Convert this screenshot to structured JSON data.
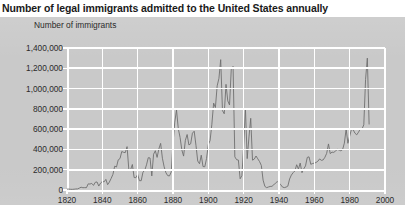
{
  "title": "Number of legal immigrants admitted to the United States annually",
  "axis_label_y": "Number of immigrants",
  "colors": {
    "panel_background": "#c9c9c9",
    "page_background": "#ffffff",
    "gridline": "#ffffff",
    "series_line": "#6e6e6e",
    "title_text": "#1a1a1a",
    "tick_text": "#2b2b2b"
  },
  "chart_data": {
    "type": "line",
    "title": "Number of legal immigrants admitted to the United States annually",
    "xlabel": "",
    "ylabel": "Number of immigrants",
    "xlim": [
      1820,
      2000
    ],
    "ylim": [
      0,
      1400000
    ],
    "grid": true,
    "legend_position": "none",
    "x_tick_labels": [
      "1820",
      "1840",
      "1860",
      "1880",
      "1900",
      "1920",
      "1940",
      "1960",
      "1980",
      "2000"
    ],
    "x_ticks": [
      1820,
      1840,
      1860,
      1880,
      1900,
      1920,
      1940,
      1960,
      1980,
      2000
    ],
    "y_tick_labels": [
      "0",
      "200,000",
      "400,000",
      "600,000",
      "800,000",
      "1,000,000",
      "1,200,000",
      "1,400,000"
    ],
    "y_ticks": [
      0,
      200000,
      400000,
      600000,
      800000,
      1000000,
      1200000,
      1400000
    ],
    "series": [
      {
        "name": "Legal immigrants admitted annually",
        "x": [
          1820,
          1821,
          1822,
          1823,
          1824,
          1825,
          1826,
          1827,
          1828,
          1829,
          1830,
          1831,
          1832,
          1833,
          1834,
          1835,
          1836,
          1837,
          1838,
          1839,
          1840,
          1841,
          1842,
          1843,
          1844,
          1845,
          1846,
          1847,
          1848,
          1849,
          1850,
          1851,
          1852,
          1853,
          1854,
          1855,
          1856,
          1857,
          1858,
          1859,
          1860,
          1861,
          1862,
          1863,
          1864,
          1865,
          1866,
          1867,
          1868,
          1869,
          1870,
          1871,
          1872,
          1873,
          1874,
          1875,
          1876,
          1877,
          1878,
          1879,
          1880,
          1881,
          1882,
          1883,
          1884,
          1885,
          1886,
          1887,
          1888,
          1889,
          1890,
          1891,
          1892,
          1893,
          1894,
          1895,
          1896,
          1897,
          1898,
          1899,
          1900,
          1901,
          1902,
          1903,
          1904,
          1905,
          1906,
          1907,
          1908,
          1909,
          1910,
          1911,
          1912,
          1913,
          1914,
          1915,
          1916,
          1917,
          1918,
          1919,
          1920,
          1921,
          1922,
          1923,
          1924,
          1925,
          1926,
          1927,
          1928,
          1929,
          1930,
          1931,
          1932,
          1933,
          1934,
          1935,
          1936,
          1937,
          1938,
          1939,
          1940,
          1941,
          1942,
          1943,
          1944,
          1945,
          1946,
          1947,
          1948,
          1949,
          1950,
          1951,
          1952,
          1953,
          1954,
          1955,
          1956,
          1957,
          1958,
          1959,
          1960,
          1961,
          1962,
          1963,
          1964,
          1965,
          1966,
          1967,
          1968,
          1969,
          1970,
          1971,
          1972,
          1973,
          1974,
          1975,
          1976,
          1977,
          1978,
          1979,
          1980,
          1981,
          1982,
          1983,
          1984,
          1985,
          1986,
          1987,
          1988,
          1989,
          1990,
          1991
        ],
        "values": [
          8400,
          9100,
          6900,
          6400,
          7900,
          10200,
          10800,
          18900,
          27400,
          22500,
          23300,
          22600,
          60500,
          58600,
          65400,
          45400,
          76200,
          79300,
          38900,
          68100,
          84100,
          80300,
          104600,
          52500,
          78600,
          114400,
          154400,
          235000,
          226500,
          297000,
          310000,
          379500,
          371600,
          368600,
          427800,
          200900,
          200400,
          251300,
          123100,
          121300,
          153600,
          91900,
          91900,
          176300,
          193400,
          248100,
          318600,
          315700,
          138800,
          352800,
          387200,
          321400,
          404800,
          459800,
          313300,
          227500,
          169900,
          141900,
          138500,
          177800,
          457300,
          669400,
          788900,
          603300,
          518600,
          395300,
          334200,
          490100,
          546900,
          444400,
          455300,
          560300,
          579700,
          439700,
          285600,
          258500,
          343300,
          230800,
          229300,
          311700,
          448600,
          487900,
          648700,
          857000,
          812900,
          1026500,
          1100700,
          1285300,
          782900,
          751800,
          1041600,
          878600,
          838200,
          1197900,
          1218500,
          326700,
          298800,
          295400,
          110600,
          141100,
          430000,
          805200,
          309600,
          522900,
          706900,
          294300,
          304500,
          335200,
          307300,
          279700,
          241700,
          97100,
          35600,
          23100,
          29500,
          34900,
          36300,
          50200,
          67900,
          82900,
          70700,
          51800,
          28800,
          23700,
          28600,
          38100,
          108700,
          147300,
          170600,
          188300,
          249200,
          205700,
          265500,
          170400,
          208200,
          237800,
          321600,
          326900,
          253300,
          260700,
          265400,
          271300,
          283800,
          306300,
          292200,
          296700,
          323000,
          361900,
          454400,
          358600,
          373300,
          370500,
          384700,
          400100,
          394900,
          386200,
          398600,
          462300,
          601400,
          460300,
          530600,
          596600,
          594100,
          559800,
          543900,
          570000,
          601700,
          601500,
          643000,
          1090900,
          1536500,
          650000
        ]
      }
    ],
    "annotations": [
      {
        "text": "Peak 1907",
        "value": 1285300
      },
      {
        "text": "Peak 1914",
        "value": 1218500
      },
      {
        "text": "Depression trough 1933",
        "value": 23100
      }
    ]
  }
}
